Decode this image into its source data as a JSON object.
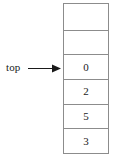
{
  "diagram": {
    "type": "stack",
    "pointer": {
      "label": "top",
      "points_to_index": 2,
      "arrow_glyph": "→"
    },
    "colors": {
      "background": "#ffffff",
      "border": "#8c8c8c",
      "text": "#1a1a1a"
    },
    "cells": [
      {
        "index": 0,
        "value": "",
        "empty": true
      },
      {
        "index": 1,
        "value": "",
        "empty": true
      },
      {
        "index": 2,
        "value": "0",
        "empty": false
      },
      {
        "index": 3,
        "value": "2",
        "empty": false
      },
      {
        "index": 4,
        "value": "5",
        "empty": false
      },
      {
        "index": 5,
        "value": "3",
        "empty": false
      }
    ]
  }
}
